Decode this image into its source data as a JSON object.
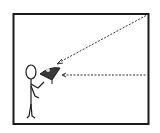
{
  "diagram": {
    "title": "",
    "colors": {
      "stroke": "#1a1a1a",
      "background": "#ffffff",
      "protractor_fill": "#3a3a3a",
      "dash": "#333333"
    },
    "elements": [
      {
        "id": "frame",
        "type": "rectangle"
      },
      {
        "id": "person",
        "type": "stick-figure"
      },
      {
        "id": "clinometer",
        "type": "protractor"
      },
      {
        "id": "horizontal-sightline",
        "type": "dashed-line"
      },
      {
        "id": "angled-sightline",
        "type": "dashed-arrow"
      }
    ]
  }
}
